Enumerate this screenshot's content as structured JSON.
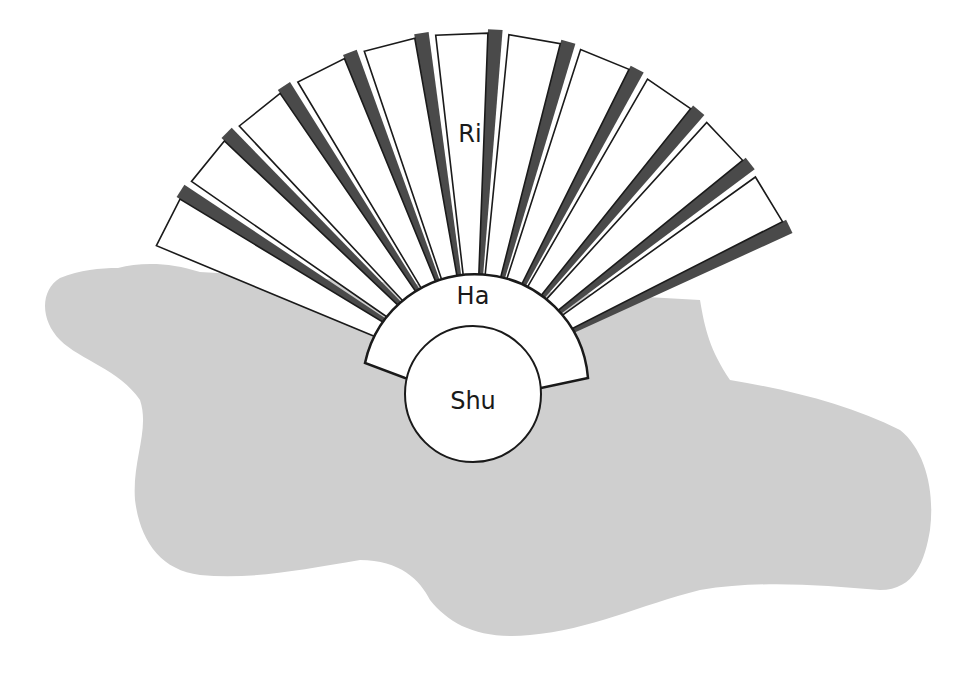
{
  "diagram": {
    "type": "fan",
    "colors": {
      "background": "#ffffff",
      "blob": "#cfcfcf",
      "blade_fill": "#ffffff",
      "blade_outline": "#1a1a1a",
      "blade_shadow": "#4a4a4a"
    },
    "blade_count": 11,
    "labels": {
      "outer": "Ri",
      "middle": "Ha",
      "inner": "Shu"
    }
  }
}
